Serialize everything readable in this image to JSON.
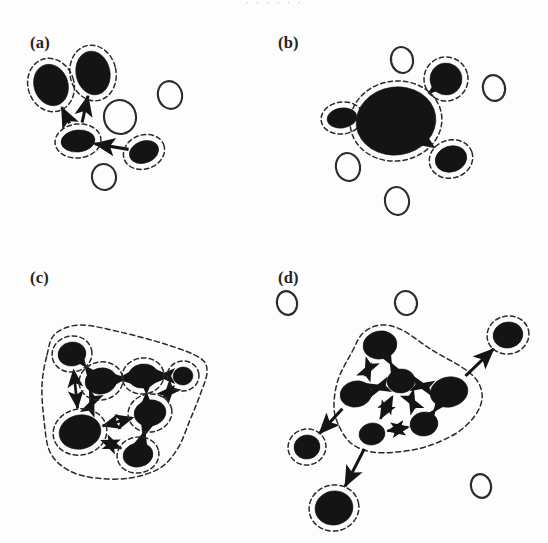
{
  "figure": {
    "title_cut_off": "· · · · · ·",
    "background": "#fdfdfd",
    "ink": "#141414",
    "width": 548,
    "height": 543
  },
  "panels": [
    {
      "id": "a",
      "label": "(a)",
      "label_x": 30,
      "label_y": 48,
      "caption_meaning": "sparse directed graph, four selected nodes each with own dashed halo",
      "filled_nodes": [
        {
          "name": "a-node-upper-left",
          "cx": 51,
          "cy": 85,
          "rx": 17,
          "ry": 21,
          "rot": -18
        },
        {
          "name": "a-node-upper-right",
          "cx": 93,
          "cy": 73,
          "rx": 17,
          "ry": 22,
          "rot": -12
        },
        {
          "name": "a-node-center",
          "cx": 78,
          "cy": 141,
          "rx": 17,
          "ry": 11,
          "rot": -6
        },
        {
          "name": "a-node-right",
          "cx": 144,
          "cy": 152,
          "rx": 15,
          "ry": 11,
          "rot": -20
        }
      ],
      "open_nodes": [
        {
          "name": "a-open-middle",
          "cx": 120,
          "cy": 117,
          "rx": 16,
          "ry": 17,
          "rot": -10
        },
        {
          "name": "a-open-right",
          "cx": 170,
          "cy": 95,
          "rx": 12,
          "ry": 14,
          "rot": -15
        },
        {
          "name": "a-open-bottom",
          "cx": 104,
          "cy": 177,
          "rx": 12,
          "ry": 13,
          "rot": -12
        }
      ],
      "edges": [
        {
          "name": "a-edge-center-to-upper-left",
          "from": "a-node-center",
          "to": "a-node-upper-left",
          "arrow": "forward"
        },
        {
          "name": "a-edge-center-to-upper-right",
          "from": "a-node-center",
          "to": "a-node-upper-right",
          "arrow": "forward"
        },
        {
          "name": "a-edge-right-to-center",
          "from": "a-node-right",
          "to": "a-node-center",
          "arrow": "forward"
        }
      ]
    },
    {
      "id": "b",
      "label": "(b)",
      "label_x": 278,
      "label_y": 48,
      "caption_meaning": "coarse-grained graph, cluster merged into one large supernode",
      "filled_nodes": [
        {
          "name": "b-node-super",
          "cx": 396,
          "cy": 121,
          "rx": 40,
          "ry": 34,
          "rot": -8
        },
        {
          "name": "b-node-upper-right",
          "cx": 446,
          "cy": 79,
          "rx": 16,
          "ry": 16,
          "rot": -10
        },
        {
          "name": "b-node-left",
          "cx": 342,
          "cy": 118,
          "rx": 15,
          "ry": 10,
          "rot": -8
        },
        {
          "name": "b-node-lower-right",
          "cx": 451,
          "cy": 159,
          "rx": 16,
          "ry": 13,
          "rot": -18
        }
      ],
      "open_nodes": [
        {
          "name": "b-open-top",
          "cx": 402,
          "cy": 60,
          "rx": 11,
          "ry": 13,
          "rot": -12
        },
        {
          "name": "b-open-far-right",
          "cx": 494,
          "cy": 88,
          "rx": 11,
          "ry": 13,
          "rot": -14
        },
        {
          "name": "b-open-lower-left",
          "cx": 348,
          "cy": 167,
          "rx": 12,
          "ry": 14,
          "rot": -12
        },
        {
          "name": "b-open-bottom",
          "cx": 397,
          "cy": 201,
          "rx": 12,
          "ry": 14,
          "rot": -10
        }
      ],
      "edges": [
        {
          "name": "b-edge-super-to-upper-right",
          "from": "b-node-super",
          "to": "b-node-upper-right",
          "arrow": "forward"
        },
        {
          "name": "b-edge-super-to-left",
          "from": "b-node-super",
          "to": "b-node-left",
          "arrow": "forward"
        },
        {
          "name": "b-edge-super-to-lower-right",
          "from": "b-node-super",
          "to": "b-node-lower-right",
          "arrow": "forward"
        }
      ]
    },
    {
      "id": "c",
      "label": "(c)",
      "label_x": 30,
      "label_y": 283,
      "caption_meaning": "dense bidirectional graph, all seven nodes in one dashed cluster",
      "filled_nodes": [
        {
          "name": "c-node-top-left",
          "cx": 72,
          "cy": 354,
          "rx": 14,
          "ry": 12,
          "rot": -10
        },
        {
          "name": "c-node-left-mid",
          "cx": 101,
          "cy": 381,
          "rx": 16,
          "ry": 13,
          "rot": -12
        },
        {
          "name": "c-node-top-mid",
          "cx": 143,
          "cy": 376,
          "rx": 15,
          "ry": 12,
          "rot": -8
        },
        {
          "name": "c-node-top-right",
          "cx": 183,
          "cy": 376,
          "rx": 10,
          "ry": 9,
          "rot": -8
        },
        {
          "name": "c-node-center-right",
          "cx": 150,
          "cy": 413,
          "rx": 16,
          "ry": 13,
          "rot": -10
        },
        {
          "name": "c-node-bottom-left",
          "cx": 80,
          "cy": 432,
          "rx": 21,
          "ry": 17,
          "rot": -12
        },
        {
          "name": "c-node-bottom-mid",
          "cx": 138,
          "cy": 455,
          "rx": 15,
          "ry": 12,
          "rot": -10
        }
      ],
      "open_nodes": [],
      "edges": [
        {
          "name": "c-edge-top-left--left-mid",
          "from": "c-node-top-left",
          "to": "c-node-left-mid",
          "arrow": "both"
        },
        {
          "name": "c-edge-top-left--bottom-left",
          "from": "c-node-top-left",
          "to": "c-node-bottom-left",
          "arrow": "both"
        },
        {
          "name": "c-edge-left-mid--top-mid",
          "from": "c-node-left-mid",
          "to": "c-node-top-mid",
          "arrow": "both"
        },
        {
          "name": "c-edge-left-mid--bottom-left",
          "from": "c-node-left-mid",
          "to": "c-node-bottom-left",
          "arrow": "both"
        },
        {
          "name": "c-edge-top-mid--top-right",
          "from": "c-node-top-mid",
          "to": "c-node-top-right",
          "arrow": "both"
        },
        {
          "name": "c-edge-top-mid--center-right",
          "from": "c-node-top-mid",
          "to": "c-node-center-right",
          "arrow": "both"
        },
        {
          "name": "c-edge-top-right--center-right",
          "from": "c-node-top-right",
          "to": "c-node-center-right",
          "arrow": "both"
        },
        {
          "name": "c-edge-center-right--bottom-left",
          "from": "c-node-center-right",
          "to": "c-node-bottom-left",
          "arrow": "both"
        },
        {
          "name": "c-edge-center-right--bottom-mid",
          "from": "c-node-center-right",
          "to": "c-node-bottom-mid",
          "arrow": "both"
        },
        {
          "name": "c-edge-bottom-left--bottom-mid",
          "from": "c-node-bottom-left",
          "to": "c-node-bottom-mid",
          "arrow": "both"
        }
      ],
      "hull": [
        [
          47,
          355
        ],
        [
          55,
          334
        ],
        [
          80,
          325
        ],
        [
          120,
          332
        ],
        [
          168,
          345
        ],
        [
          200,
          358
        ],
        [
          207,
          372
        ],
        [
          200,
          395
        ],
        [
          190,
          420
        ],
        [
          178,
          448
        ],
        [
          160,
          468
        ],
        [
          130,
          478
        ],
        [
          95,
          478
        ],
        [
          68,
          470
        ],
        [
          50,
          452
        ],
        [
          44,
          420
        ],
        [
          42,
          385
        ]
      ]
    },
    {
      "id": "d",
      "label": "(d)",
      "label_x": 278,
      "label_y": 283,
      "caption_meaning": "core cluster of six nodes plus three haloed peripheral nodes",
      "filled_nodes": [
        {
          "name": "d-node-core-top",
          "cx": 380,
          "cy": 345,
          "rx": 17,
          "ry": 14,
          "rot": -10
        },
        {
          "name": "d-node-core-left",
          "cx": 356,
          "cy": 394,
          "rx": 16,
          "ry": 13,
          "rot": -12
        },
        {
          "name": "d-node-core-center",
          "cx": 401,
          "cy": 381,
          "rx": 14,
          "ry": 12,
          "rot": -8
        },
        {
          "name": "d-node-core-right",
          "cx": 449,
          "cy": 392,
          "rx": 19,
          "ry": 15,
          "rot": -12
        },
        {
          "name": "d-node-core-lowmid",
          "cx": 424,
          "cy": 424,
          "rx": 14,
          "ry": 12,
          "rot": -10
        },
        {
          "name": "d-node-core-bottom",
          "cx": 372,
          "cy": 434,
          "rx": 13,
          "ry": 11,
          "rot": -10
        },
        {
          "name": "d-node-periph-upper-right",
          "cx": 508,
          "cy": 335,
          "rx": 15,
          "ry": 13,
          "rot": -12
        },
        {
          "name": "d-node-periph-left",
          "cx": 307,
          "cy": 447,
          "rx": 13,
          "ry": 12,
          "rot": -12
        },
        {
          "name": "d-node-periph-bottom",
          "cx": 334,
          "cy": 508,
          "rx": 19,
          "ry": 17,
          "rot": -12
        }
      ],
      "open_nodes": [
        {
          "name": "d-open-top-left",
          "cx": 287,
          "cy": 303,
          "rx": 10,
          "ry": 12,
          "rot": -14
        },
        {
          "name": "d-open-top-mid",
          "cx": 406,
          "cy": 303,
          "rx": 11,
          "ry": 12,
          "rot": -12
        },
        {
          "name": "d-open-bottom-right",
          "cx": 481,
          "cy": 486,
          "rx": 10,
          "ry": 12,
          "rot": -14
        }
      ],
      "edges": [
        {
          "name": "d-edge-core-top--core-left",
          "from": "d-node-core-top",
          "to": "d-node-core-left",
          "arrow": "both"
        },
        {
          "name": "d-edge-core-top--core-center",
          "from": "d-node-core-top",
          "to": "d-node-core-center",
          "arrow": "both"
        },
        {
          "name": "d-edge-core-left--core-center",
          "from": "d-node-core-left",
          "to": "d-node-core-center",
          "arrow": "both"
        },
        {
          "name": "d-edge-core-center--core-right",
          "from": "d-node-core-center",
          "to": "d-node-core-right",
          "arrow": "both"
        },
        {
          "name": "d-edge-core-center--core-lowmid",
          "from": "d-node-core-center",
          "to": "d-node-core-lowmid",
          "arrow": "both"
        },
        {
          "name": "d-edge-core-center--core-bottom",
          "from": "d-node-core-center",
          "to": "d-node-core-bottom",
          "arrow": "both"
        },
        {
          "name": "d-edge-core-right--core-lowmid",
          "from": "d-node-core-right",
          "to": "d-node-core-lowmid",
          "arrow": "both"
        },
        {
          "name": "d-edge-core-lowmid--core-bottom",
          "from": "d-node-core-lowmid",
          "to": "d-node-core-bottom",
          "arrow": "both"
        },
        {
          "name": "d-edge-core-right--periph-upper-right",
          "from": "d-node-core-right",
          "to": "d-node-periph-upper-right",
          "arrow": "forward"
        },
        {
          "name": "d-edge-core-left--periph-left",
          "from": "d-node-core-left",
          "to": "d-node-periph-left",
          "arrow": "forward"
        },
        {
          "name": "d-edge-core-bottom--periph-bottom",
          "from": "d-node-core-bottom",
          "to": "d-node-periph-bottom",
          "arrow": "forward"
        }
      ],
      "hull": [
        [
          352,
          352
        ],
        [
          363,
          333
        ],
        [
          381,
          325
        ],
        [
          402,
          330
        ],
        [
          432,
          350
        ],
        [
          463,
          368
        ],
        [
          478,
          382
        ],
        [
          482,
          399
        ],
        [
          474,
          417
        ],
        [
          455,
          434
        ],
        [
          425,
          447
        ],
        [
          397,
          452
        ],
        [
          372,
          452
        ],
        [
          352,
          444
        ],
        [
          340,
          428
        ],
        [
          334,
          408
        ],
        [
          338,
          380
        ]
      ]
    }
  ]
}
